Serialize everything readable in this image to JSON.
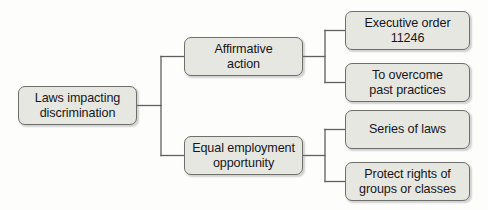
{
  "diagram": {
    "type": "hierarchy-tree",
    "title": "Laws impacting discrimination",
    "orientation": "left-to-right",
    "colors": {
      "box_fill": "#e7e7e2",
      "box_border": "#6f706c",
      "text": "#16161a",
      "connector": "#5f6060",
      "background": "#fdfdfc"
    },
    "root": {
      "label": "Laws impacting\ndiscrimination",
      "x": 18,
      "y": 86,
      "width": 119,
      "height": 39
    },
    "level1": [
      {
        "id": "affirmative-action",
        "label": "Affirmative\naction",
        "x": 184,
        "y": 37,
        "width": 119,
        "height": 39
      },
      {
        "id": "equal-employment-opportunity",
        "label": "Equal employment\nopportunity",
        "x": 184,
        "y": 136,
        "width": 119,
        "height": 39
      }
    ],
    "level2": [
      {
        "id": "executive-order-11246",
        "parent": "affirmative-action",
        "label": "Executive order\n11246",
        "x": 345,
        "y": 11,
        "width": 125,
        "height": 39
      },
      {
        "id": "to-overcome-past-practices",
        "parent": "affirmative-action",
        "label": "To overcome\npast practices",
        "x": 345,
        "y": 63,
        "width": 125,
        "height": 39
      },
      {
        "id": "series-of-laws",
        "parent": "equal-employment-opportunity",
        "label": "Series of laws",
        "x": 345,
        "y": 110,
        "width": 125,
        "height": 39
      },
      {
        "id": "protect-rights-of-groups-or-classes",
        "parent": "equal-employment-opportunity",
        "label": "Protect rights of\ngroups or classes",
        "x": 345,
        "y": 162,
        "width": 125,
        "height": 39
      }
    ],
    "connectors": [
      {
        "id": "root-stem",
        "points": "137,105.5 161,105.5"
      },
      {
        "id": "trunk-vertical",
        "points": "161,56.5 161,155.5"
      },
      {
        "id": "branch-top",
        "points": "161,56.5 184,56.5"
      },
      {
        "id": "branch-bottom",
        "points": "161,155.5 184,155.5"
      },
      {
        "id": "aa-stem",
        "points": "303,56.5 325,56.5"
      },
      {
        "id": "aa-vertical",
        "points": "325,30.5 325,82.5"
      },
      {
        "id": "aa-to-eo11246",
        "points": "325,30.5 345,30.5"
      },
      {
        "id": "aa-to-overcome",
        "points": "325,82.5 345,82.5"
      },
      {
        "id": "eeo-stem",
        "points": "303,155.5 325,155.5"
      },
      {
        "id": "eeo-vertical",
        "points": "325,129.5 325,181.5"
      },
      {
        "id": "eeo-to-series",
        "points": "325,129.5 345,129.5"
      },
      {
        "id": "eeo-to-protect",
        "points": "325,181.5 345,181.5"
      }
    ]
  }
}
